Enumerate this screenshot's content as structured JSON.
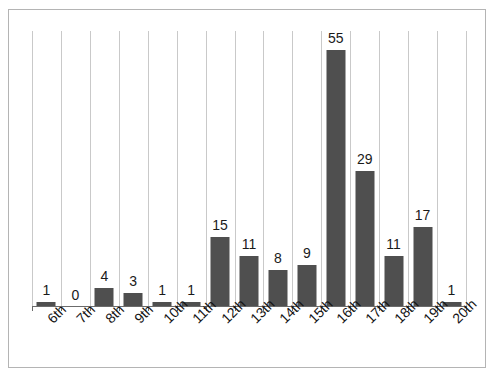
{
  "chart_data": {
    "type": "bar",
    "title": "",
    "subtitle": "",
    "xlabel": "",
    "ylabel": "",
    "categories": [
      "6th",
      "7th",
      "8th",
      "9th",
      "10th",
      "11th",
      "12th",
      "13th",
      "14th",
      "15th",
      "16th",
      "17th",
      "18th",
      "19th",
      "20th"
    ],
    "values": [
      1,
      0,
      4,
      3,
      1,
      1,
      15,
      11,
      8,
      9,
      55,
      29,
      11,
      17,
      1
    ],
    "value_labels": [
      "1",
      "0",
      "4",
      "3",
      "1",
      "1",
      "15",
      "11",
      "8",
      "9",
      "55",
      "29",
      "11",
      "17",
      "1"
    ],
    "ylim": [
      0,
      59
    ],
    "grid": {
      "vertical": true,
      "horizontal": false
    },
    "legend": null,
    "annotations": [],
    "colors": {
      "bar": "#4f4f4f",
      "gridline": "#c9c9c9",
      "axis": "#6b6b6b",
      "frame": "#b4b4b4",
      "background": "#ffffff",
      "text": "#141414"
    },
    "x_label_rotation_deg": -45
  }
}
